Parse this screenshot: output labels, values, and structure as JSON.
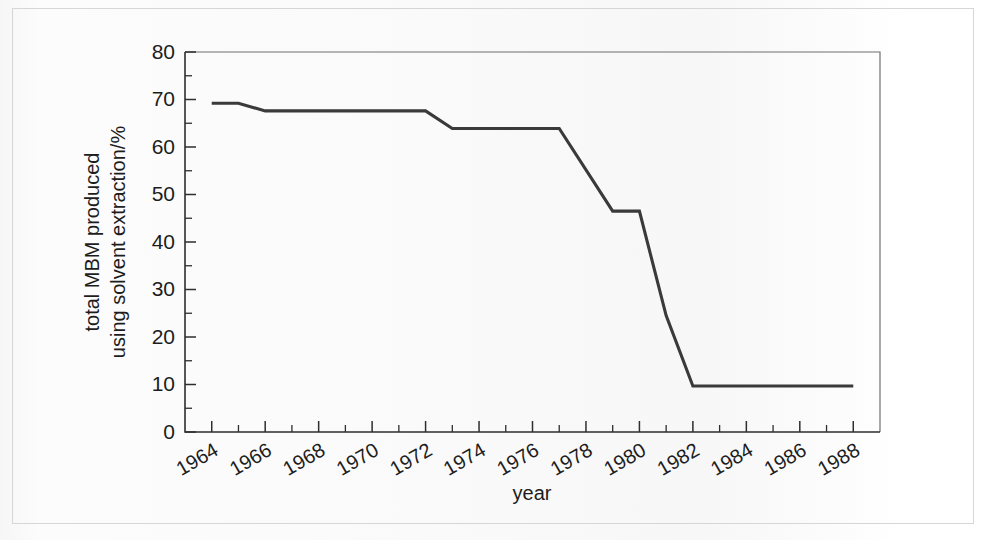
{
  "chart_data": {
    "type": "line",
    "title": "",
    "xlabel": "year",
    "ylabel_line1": "total MBM produced",
    "ylabel_line2": "using solvent extraction/%",
    "ylabel": "total MBM produced using solvent extraction/%",
    "xlim": [
      1963,
      1989
    ],
    "ylim": [
      0,
      80
    ],
    "ytick_labels": [
      "0",
      "10",
      "20",
      "30",
      "40",
      "50",
      "60",
      "70",
      "80"
    ],
    "ytick_values": [
      0,
      10,
      20,
      30,
      40,
      50,
      60,
      70,
      80
    ],
    "yminor_step": 5,
    "xtick_labels": [
      "1964",
      "1966",
      "1968",
      "1970",
      "1972",
      "1974",
      "1976",
      "1978",
      "1980",
      "1982",
      "1984",
      "1986",
      "1988"
    ],
    "xtick_values": [
      1964,
      1966,
      1968,
      1970,
      1972,
      1974,
      1976,
      1978,
      1980,
      1982,
      1984,
      1986,
      1988
    ],
    "xminor_step": 1,
    "xtick_rotation_deg": 30,
    "grid": false,
    "legend": false,
    "legend_position": "none",
    "series": [
      {
        "name": "total MBM produced using solvent extraction",
        "color": "#3a3a3a",
        "x": [
          1964,
          1965,
          1966,
          1972,
          1973,
          1977,
          1979,
          1980,
          1981,
          1982,
          1988
        ],
        "values": [
          69.2,
          69.2,
          67.6,
          67.6,
          63.9,
          63.9,
          46.5,
          46.5,
          24.5,
          9.7,
          9.7
        ]
      }
    ],
    "points": [
      {
        "x": 1964,
        "y": 69.2
      },
      {
        "x": 1965,
        "y": 69.2
      },
      {
        "x": 1966,
        "y": 67.6
      },
      {
        "x": 1972,
        "y": 67.6
      },
      {
        "x": 1973,
        "y": 63.9
      },
      {
        "x": 1977,
        "y": 63.9
      },
      {
        "x": 1979,
        "y": 46.5
      },
      {
        "x": 1980,
        "y": 46.5
      },
      {
        "x": 1981,
        "y": 24.5
      },
      {
        "x": 1982,
        "y": 9.7
      },
      {
        "x": 1988,
        "y": 9.7
      }
    ],
    "colors": {
      "line": "#3a3a3a",
      "axis": "#2e2e2e",
      "frame": "#6f6f6f",
      "text": "#1d1d1d",
      "background": "#fdfdfd"
    }
  }
}
